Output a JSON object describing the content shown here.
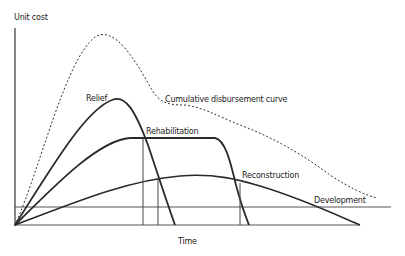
{
  "diagram": {
    "y_axis_label": "Unit cost",
    "x_axis_label": "Time",
    "curves": [
      {
        "name": "Relief",
        "style": "solid"
      },
      {
        "name": "Rehabilitation",
        "style": "solid"
      },
      {
        "name": "Reconstruction",
        "style": "solid"
      },
      {
        "name": "Development",
        "style": "solid"
      },
      {
        "name": "Cumulative disbursement curve",
        "style": "dotted"
      }
    ],
    "labels": {
      "relief": "Relief",
      "rehabilitation": "Rehabilitation",
      "cumulative": "Cumulative disbursement curve",
      "reconstruction": "Reconstruction",
      "development": "Development"
    },
    "colors": {
      "line": "#2a2a2a",
      "background": "#ffffff"
    }
  }
}
